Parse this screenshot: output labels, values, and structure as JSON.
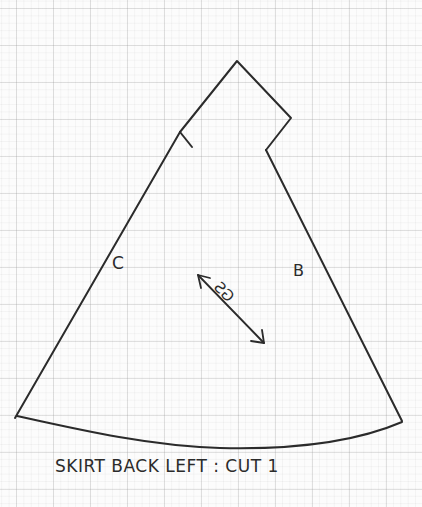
{
  "pattern": {
    "title": "SKIRT BACK LEFT : CUT 1",
    "labels": {
      "left_seam": "C",
      "right_seam": "B",
      "grainline": "GS"
    },
    "colors": {
      "ink": "#2b2b2b",
      "paper": "#fcfcfc",
      "grid": "#a0a0a0"
    }
  }
}
